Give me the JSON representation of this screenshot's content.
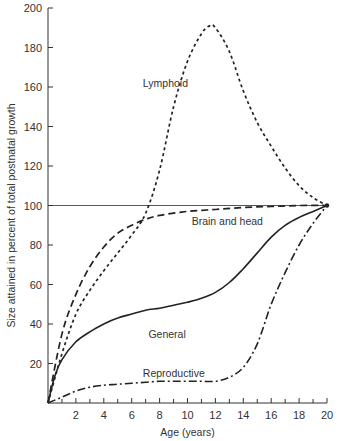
{
  "chart_data": {
    "type": "line",
    "title": "",
    "xlabel": "Age (years)",
    "ylabel": "Size attained in percent of total postnatal growth",
    "xlim": [
      0,
      20
    ],
    "ylim": [
      0,
      200
    ],
    "x_ticks": [
      2,
      4,
      6,
      8,
      10,
      12,
      14,
      16,
      18,
      20
    ],
    "x_minor_ticks": [
      1,
      3,
      5,
      7,
      9,
      11,
      13,
      15,
      17,
      19
    ],
    "y_ticks": [
      20,
      40,
      60,
      80,
      100,
      120,
      140,
      160,
      180,
      200
    ],
    "grid": false,
    "reference_line": {
      "y": 100,
      "style": "solid-thin"
    },
    "legend": "inline-labels",
    "series": [
      {
        "name": "Lymphoid",
        "style": "dotted",
        "label_pos": {
          "x": 6.8,
          "y": 162
        },
        "x": [
          0,
          1,
          2,
          3,
          4,
          5,
          6,
          7,
          8,
          9,
          10,
          11,
          11.6,
          12,
          13,
          14,
          15,
          16,
          17,
          18,
          19,
          20
        ],
        "values": [
          0,
          25,
          45,
          57,
          67,
          76,
          85,
          96,
          118,
          150,
          173,
          187,
          191,
          190,
          178,
          158,
          142,
          130,
          119,
          110,
          104,
          100
        ]
      },
      {
        "name": "Brain and head",
        "style": "dashed",
        "label_pos": {
          "x": 10.3,
          "y": 92
        },
        "x": [
          0,
          1,
          2,
          3,
          4,
          5,
          6,
          7,
          8,
          10,
          12,
          14,
          16,
          18,
          20
        ],
        "values": [
          0,
          35,
          55,
          69,
          79,
          86,
          90,
          93,
          95,
          97,
          98,
          99,
          99.5,
          100,
          100
        ]
      },
      {
        "name": "General",
        "style": "solid",
        "label_pos": {
          "x": 7.2,
          "y": 35
        },
        "x": [
          0,
          0.5,
          1,
          2,
          3,
          4,
          5,
          6,
          7,
          8,
          9,
          10,
          11,
          12,
          13,
          14,
          15,
          16,
          17,
          18,
          19,
          20
        ],
        "values": [
          0,
          14,
          22,
          31,
          36,
          40,
          43,
          45,
          47,
          48,
          49.5,
          51,
          53,
          56,
          61,
          68,
          76,
          84,
          90,
          94,
          97,
          100
        ]
      },
      {
        "name": "Reproductive",
        "style": "dash-dot",
        "label_pos": {
          "x": 6.8,
          "y": 15
        },
        "x": [
          0,
          1,
          2,
          3,
          4,
          5,
          6,
          7,
          8,
          9,
          10,
          11,
          12,
          13,
          14,
          15,
          16,
          17,
          18,
          19,
          20
        ],
        "values": [
          0,
          3,
          6,
          8,
          9,
          9.5,
          10,
          10.5,
          11,
          11,
          11,
          11,
          11,
          13,
          18,
          30,
          50,
          66,
          80,
          91,
          100
        ]
      }
    ]
  }
}
